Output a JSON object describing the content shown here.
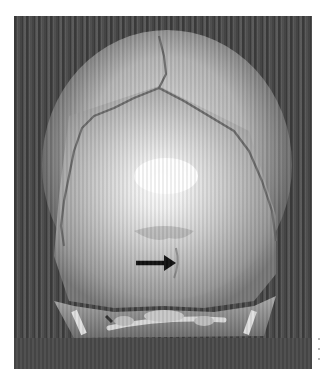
{
  "image": {
    "subject": "3D CT reconstruction of skull, posterior view",
    "annotation": {
      "type": "arrow",
      "direction": "right",
      "color": "#111111"
    },
    "colors": {
      "background": "#4a4a4a",
      "bone_highlight": "#f5f5f5",
      "bone_mid": "#bdbdbd",
      "page": "#ffffff"
    }
  }
}
